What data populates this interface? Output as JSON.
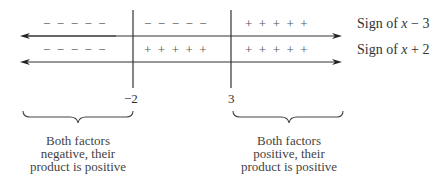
{
  "diagram": {
    "type": "sign chart",
    "critical_points": [
      {
        "label": "−2",
        "x": 133
      },
      {
        "label": "3",
        "x": 231
      }
    ],
    "rows": [
      {
        "label_prefix": "Sign of ",
        "label_var": "x",
        "label_suffix": " − 3",
        "segments": [
          "−  −  −  −  −",
          "−  −  −  −  −",
          "+  +  +  +  +"
        ]
      },
      {
        "label_prefix": "Sign of ",
        "label_var": "x",
        "label_suffix": " + 2",
        "segments": [
          "−  −  −  −  −",
          "+  +  +  +  +",
          "+  +  +  +  +"
        ]
      }
    ],
    "captions": [
      {
        "lines": [
          "Both factors",
          "negative, their",
          "product is positive"
        ]
      },
      {
        "lines": [
          "Both factors",
          "positive, their",
          "product is positive"
        ]
      }
    ]
  }
}
